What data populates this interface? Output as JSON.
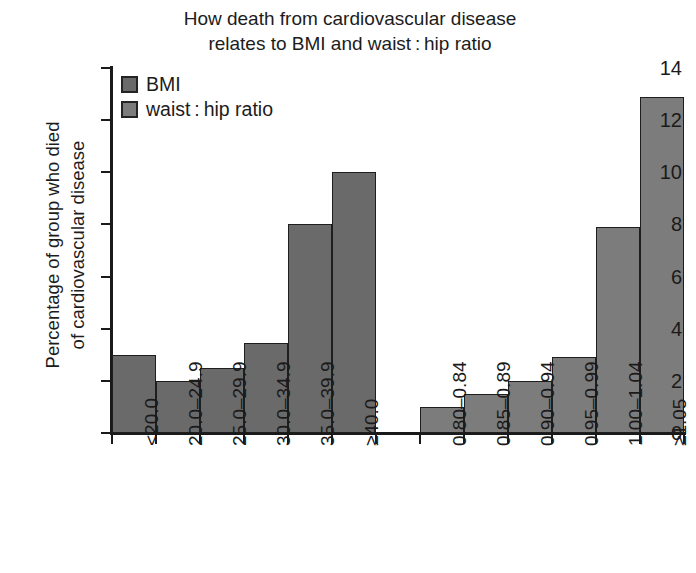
{
  "chart_data": {
    "type": "bar",
    "title_lines": [
      "How death from cardiovascular disease",
      "relates to BMI and waist : hip ratio"
    ],
    "xlabel": "",
    "ylabel": "Percentage of group who died of cardiovascular disease",
    "ylabel_lines": [
      "Percentage of group who died",
      "of cardiovascular disease"
    ],
    "ylim": [
      0,
      14
    ],
    "ytick_values": [
      0,
      2,
      4,
      6,
      8,
      10,
      12,
      14
    ],
    "ytick_labels": [
      "0",
      "2",
      "4",
      "6",
      "8",
      "10",
      "12",
      "14"
    ],
    "grid": false,
    "legend_position": "top-left",
    "legend": [
      {
        "name": "BMI",
        "color": "#6a6a6a"
      },
      {
        "name": "waist : hip ratio",
        "color": "#7c7c7c"
      }
    ],
    "groups": [
      {
        "name": "BMI",
        "color": "#6a6a6a",
        "categories": [
          "<20.0",
          "20.0–24.9",
          "25.0–29.9",
          "30.0–34.9",
          "35.0–39.9",
          "≥40.0"
        ],
        "values": [
          3.0,
          2.0,
          2.5,
          3.45,
          8.0,
          10.0
        ]
      },
      {
        "name": "waist:hip ratio",
        "color": "#7c7c7c",
        "categories": [
          "0.80–0.84",
          "0.85–0.89",
          "0.90–0.94",
          "0.95–0.99",
          "1.00–1.04",
          "≥1.05"
        ],
        "values": [
          1.0,
          1.5,
          2.0,
          2.9,
          7.9,
          12.9
        ]
      }
    ],
    "categories": [
      "<20.0",
      "20.0–24.9",
      "25.0–29.9",
      "30.0–34.9",
      "35.0–39.9",
      "≥40.0",
      "0.80–0.84",
      "0.85–0.89",
      "0.90–0.94",
      "0.95–0.99",
      "1.00–1.04",
      "≥1.05"
    ],
    "values": [
      3.0,
      2.0,
      2.5,
      3.45,
      8.0,
      10.0,
      1.0,
      1.5,
      2.0,
      2.9,
      7.9,
      12.9
    ],
    "axis_color": "#1a1a1a",
    "background": "#ffffff"
  }
}
